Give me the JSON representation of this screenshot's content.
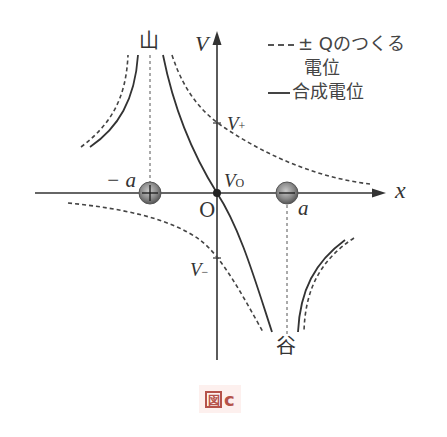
{
  "figure": {
    "caption_prefix": "図",
    "caption_letter": "c",
    "caption_color": "#b5524a"
  },
  "axes": {
    "x_label": "x",
    "y_label": "V",
    "origin_label": "O"
  },
  "labels": {
    "v_plus": "V",
    "v_plus_sub": "+",
    "v_minus": "V",
    "v_minus_sub": "−",
    "v_zero": "V",
    "v_zero_sub": "O",
    "neg_a": "− a",
    "pos_a": "a",
    "peak": "山",
    "valley": "谷"
  },
  "legend": {
    "dashed_line1": "± Qのつくる",
    "dashed_line2": "電位",
    "solid": "合成電位"
  },
  "charges": [
    {
      "name": "negative-position-charge",
      "position": "-a",
      "sign": "+"
    },
    {
      "name": "positive-position-charge",
      "position": "a",
      "sign": "-"
    }
  ],
  "colors": {
    "line": "#333333",
    "charge_fill": "#8a8a8a",
    "caption_bg": "#fdf0ee"
  }
}
